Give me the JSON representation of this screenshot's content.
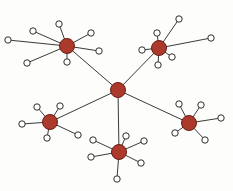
{
  "figure": {
    "width": 233,
    "height": 191,
    "background_color": "#fdfdfc"
  },
  "style": {
    "hub_fill": "#ab3a2d",
    "hub_stroke": "#6b1d14",
    "leaf_fill": "#ffffff",
    "leaf_stroke": "#2e2e2c",
    "edge_color": "#3a3a38",
    "edge_width": 1,
    "hub_radius": 7.5,
    "center_hub_radius": 7.5,
    "leaf_radius": 3.2
  },
  "chart_data": {
    "type": "scatter",
    "xlabel": "",
    "ylabel": "",
    "xlim": [
      0,
      233
    ],
    "ylim": [
      0,
      191
    ],
    "grid": false,
    "legend": "none",
    "node_count": 34,
    "edge_count": 33,
    "nodes": [
      {
        "id": "center",
        "role": "hub",
        "x": 118,
        "y": 90,
        "label": ""
      },
      {
        "id": "hub_tl",
        "role": "hub",
        "x": 67,
        "y": 46,
        "label": ""
      },
      {
        "id": "hub_tr",
        "role": "hub",
        "x": 159,
        "y": 48,
        "label": ""
      },
      {
        "id": "hub_bl",
        "role": "hub",
        "x": 50,
        "y": 122,
        "label": ""
      },
      {
        "id": "hub_bc",
        "role": "hub",
        "x": 119,
        "y": 152,
        "label": ""
      },
      {
        "id": "hub_br",
        "role": "hub",
        "x": 189,
        "y": 123,
        "label": ""
      },
      {
        "id": "tl_l1",
        "role": "leaf",
        "x": 8,
        "y": 40,
        "parent": "hub_tl"
      },
      {
        "id": "tl_l2",
        "role": "leaf",
        "x": 33,
        "y": 31,
        "parent": "hub_tl"
      },
      {
        "id": "tl_l3",
        "role": "leaf",
        "x": 59,
        "y": 24,
        "parent": "hub_tl"
      },
      {
        "id": "tl_l4",
        "role": "leaf",
        "x": 91,
        "y": 33,
        "parent": "hub_tl"
      },
      {
        "id": "tl_l5",
        "role": "leaf",
        "x": 99,
        "y": 51,
        "parent": "hub_tl"
      },
      {
        "id": "tl_l6",
        "role": "leaf",
        "x": 67,
        "y": 62,
        "parent": "hub_tl"
      },
      {
        "id": "tl_l7",
        "role": "leaf",
        "x": 27,
        "y": 63,
        "parent": "hub_tl"
      },
      {
        "id": "tr_l1",
        "role": "leaf",
        "x": 179,
        "y": 19,
        "parent": "hub_tr"
      },
      {
        "id": "tr_l2",
        "role": "leaf",
        "x": 211,
        "y": 38,
        "parent": "hub_tr"
      },
      {
        "id": "tr_l3",
        "role": "leaf",
        "x": 157,
        "y": 33,
        "parent": "hub_tr"
      },
      {
        "id": "tr_l4",
        "role": "leaf",
        "x": 142,
        "y": 50,
        "parent": "hub_tr"
      },
      {
        "id": "tr_l5",
        "role": "leaf",
        "x": 172,
        "y": 57,
        "parent": "hub_tr"
      },
      {
        "id": "tr_l6",
        "role": "leaf",
        "x": 158,
        "y": 65,
        "parent": "hub_tr"
      },
      {
        "id": "bl_l1",
        "role": "leaf",
        "x": 37,
        "y": 107,
        "parent": "hub_bl"
      },
      {
        "id": "bl_l2",
        "role": "leaf",
        "x": 60,
        "y": 106,
        "parent": "hub_bl"
      },
      {
        "id": "bl_l3",
        "role": "leaf",
        "x": 22,
        "y": 124,
        "parent": "hub_bl"
      },
      {
        "id": "bl_l4",
        "role": "leaf",
        "x": 47,
        "y": 138,
        "parent": "hub_bl"
      },
      {
        "id": "bl_l5",
        "role": "leaf",
        "x": 78,
        "y": 135,
        "parent": "hub_bl"
      },
      {
        "id": "bc_l1",
        "role": "leaf",
        "x": 93,
        "y": 140,
        "parent": "hub_bc"
      },
      {
        "id": "bc_l2",
        "role": "leaf",
        "x": 126,
        "y": 136,
        "parent": "hub_bc"
      },
      {
        "id": "bc_l3",
        "role": "leaf",
        "x": 144,
        "y": 141,
        "parent": "hub_bc"
      },
      {
        "id": "bc_l4",
        "role": "leaf",
        "x": 91,
        "y": 157,
        "parent": "hub_bc"
      },
      {
        "id": "bc_l5",
        "role": "leaf",
        "x": 141,
        "y": 163,
        "parent": "hub_bc"
      },
      {
        "id": "bc_l6",
        "role": "leaf",
        "x": 117,
        "y": 179,
        "parent": "hub_bc"
      },
      {
        "id": "br_l1",
        "role": "leaf",
        "x": 179,
        "y": 104,
        "parent": "hub_br"
      },
      {
        "id": "br_l2",
        "role": "leaf",
        "x": 201,
        "y": 105,
        "parent": "hub_br"
      },
      {
        "id": "br_l3",
        "role": "leaf",
        "x": 221,
        "y": 118,
        "parent": "hub_br"
      },
      {
        "id": "br_l4",
        "role": "leaf",
        "x": 175,
        "y": 133,
        "parent": "hub_br"
      },
      {
        "id": "br_l5",
        "role": "leaf",
        "x": 205,
        "y": 140,
        "parent": "hub_br"
      }
    ],
    "edges": [
      {
        "from": "center",
        "to": "hub_tl",
        "kind": "backbone"
      },
      {
        "from": "center",
        "to": "hub_tr",
        "kind": "backbone"
      },
      {
        "from": "center",
        "to": "hub_bl",
        "kind": "backbone"
      },
      {
        "from": "center",
        "to": "hub_bc",
        "kind": "backbone"
      },
      {
        "from": "center",
        "to": "hub_br",
        "kind": "backbone"
      },
      {
        "from": "hub_tl",
        "to": "tl_l1",
        "kind": "spoke"
      },
      {
        "from": "hub_tl",
        "to": "tl_l2",
        "kind": "spoke"
      },
      {
        "from": "hub_tl",
        "to": "tl_l3",
        "kind": "spoke"
      },
      {
        "from": "hub_tl",
        "to": "tl_l4",
        "kind": "spoke"
      },
      {
        "from": "hub_tl",
        "to": "tl_l5",
        "kind": "spoke"
      },
      {
        "from": "hub_tl",
        "to": "tl_l6",
        "kind": "spoke"
      },
      {
        "from": "hub_tl",
        "to": "tl_l7",
        "kind": "spoke"
      },
      {
        "from": "hub_tr",
        "to": "tr_l1",
        "kind": "spoke"
      },
      {
        "from": "hub_tr",
        "to": "tr_l2",
        "kind": "spoke"
      },
      {
        "from": "hub_tr",
        "to": "tr_l3",
        "kind": "spoke"
      },
      {
        "from": "hub_tr",
        "to": "tr_l4",
        "kind": "spoke"
      },
      {
        "from": "hub_tr",
        "to": "tr_l5",
        "kind": "spoke"
      },
      {
        "from": "hub_tr",
        "to": "tr_l6",
        "kind": "spoke"
      },
      {
        "from": "hub_bl",
        "to": "bl_l1",
        "kind": "spoke"
      },
      {
        "from": "hub_bl",
        "to": "bl_l2",
        "kind": "spoke"
      },
      {
        "from": "hub_bl",
        "to": "bl_l3",
        "kind": "spoke"
      },
      {
        "from": "hub_bl",
        "to": "bl_l4",
        "kind": "spoke"
      },
      {
        "from": "hub_bl",
        "to": "bl_l5",
        "kind": "spoke"
      },
      {
        "from": "hub_bc",
        "to": "bc_l1",
        "kind": "spoke"
      },
      {
        "from": "hub_bc",
        "to": "bc_l2",
        "kind": "spoke"
      },
      {
        "from": "hub_bc",
        "to": "bc_l3",
        "kind": "spoke"
      },
      {
        "from": "hub_bc",
        "to": "bc_l4",
        "kind": "spoke"
      },
      {
        "from": "hub_bc",
        "to": "bc_l5",
        "kind": "spoke"
      },
      {
        "from": "hub_bc",
        "to": "bc_l6",
        "kind": "spoke"
      },
      {
        "from": "hub_br",
        "to": "br_l1",
        "kind": "spoke"
      },
      {
        "from": "hub_br",
        "to": "br_l2",
        "kind": "spoke"
      },
      {
        "from": "hub_br",
        "to": "br_l3",
        "kind": "spoke"
      },
      {
        "from": "hub_br",
        "to": "br_l4",
        "kind": "spoke"
      },
      {
        "from": "hub_br",
        "to": "br_l5",
        "kind": "spoke"
      }
    ]
  }
}
